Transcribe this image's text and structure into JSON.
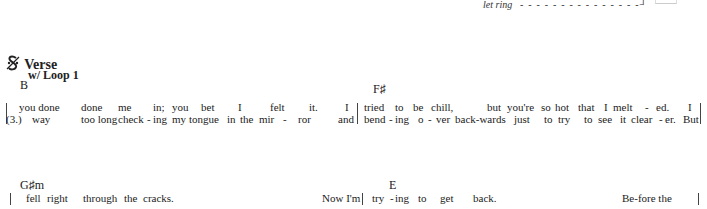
{
  "header": {
    "let_ring_label": "let ring",
    "let_ring_dashes": "- - - - - - - - - - - - - - -┘"
  },
  "section": {
    "segno_symbol": "𝄋",
    "segno_fallback": "%",
    "title": "Verse",
    "loop_label": "w/ Loop 1"
  },
  "system1": {
    "chords": [
      {
        "name": "B",
        "x": 20,
        "y": 78
      },
      {
        "name": "F♯",
        "x": 373,
        "y": 82
      }
    ],
    "line1": [
      {
        "t": "you done",
        "x": 19
      },
      {
        "t": "done",
        "x": 81
      },
      {
        "t": "me",
        "x": 118
      },
      {
        "t": "in;",
        "x": 153
      },
      {
        "t": "you",
        "x": 172
      },
      {
        "t": "bet",
        "x": 201
      },
      {
        "t": "I",
        "x": 238
      },
      {
        "t": "felt",
        "x": 270
      },
      {
        "t": "it.",
        "x": 309
      },
      {
        "t": "I",
        "x": 345
      },
      {
        "t": "tried",
        "x": 364
      },
      {
        "t": "to",
        "x": 395
      },
      {
        "t": "be",
        "x": 413
      },
      {
        "t": "chill,",
        "x": 431
      },
      {
        "t": "but",
        "x": 487
      },
      {
        "t": "you're",
        "x": 507
      },
      {
        "t": "so",
        "x": 541
      },
      {
        "t": "hot",
        "x": 555
      },
      {
        "t": "that",
        "x": 578
      },
      {
        "t": "I",
        "x": 604
      },
      {
        "t": "melt",
        "x": 613
      },
      {
        "t": "-",
        "x": 645
      },
      {
        "t": "ed.",
        "x": 656
      },
      {
        "t": "I",
        "x": 688
      }
    ],
    "line2": [
      {
        "t": "(3.)",
        "x": 6
      },
      {
        "t": "way",
        "x": 32
      },
      {
        "t": "too long",
        "x": 81
      },
      {
        "t": "check",
        "x": 118
      },
      {
        "t": "-",
        "x": 147
      },
      {
        "t": "ing",
        "x": 153
      },
      {
        "t": "my",
        "x": 172
      },
      {
        "t": "tongue",
        "x": 189
      },
      {
        "t": "in",
        "x": 227
      },
      {
        "t": "the",
        "x": 240
      },
      {
        "t": "mir",
        "x": 259
      },
      {
        "t": "-",
        "x": 283
      },
      {
        "t": "ror",
        "x": 298
      },
      {
        "t": "and",
        "x": 338
      },
      {
        "t": "bend",
        "x": 364
      },
      {
        "t": "-",
        "x": 389
      },
      {
        "t": "ing",
        "x": 395
      },
      {
        "t": "o",
        "x": 418
      },
      {
        "t": "-",
        "x": 428
      },
      {
        "t": "ver",
        "x": 436
      },
      {
        "t": "back-wards",
        "x": 455
      },
      {
        "t": "just",
        "x": 514
      },
      {
        "t": "to",
        "x": 544
      },
      {
        "t": "try",
        "x": 558
      },
      {
        "t": "to",
        "x": 584
      },
      {
        "t": "see",
        "x": 598
      },
      {
        "t": "it",
        "x": 620
      },
      {
        "t": "clear",
        "x": 631
      },
      {
        "t": "-",
        "x": 659
      },
      {
        "t": "er.",
        "x": 665
      },
      {
        "t": "But",
        "x": 683
      }
    ]
  },
  "system2": {
    "chords": [
      {
        "name": "G♯m",
        "x": 20,
        "y": 178
      },
      {
        "name": "E",
        "x": 389,
        "y": 178
      }
    ],
    "line1": [
      {
        "t": "fell",
        "x": 26
      },
      {
        "t": "right",
        "x": 47
      },
      {
        "t": "through",
        "x": 83
      },
      {
        "t": "the",
        "x": 124
      },
      {
        "t": "cracks.",
        "x": 143
      },
      {
        "t": "Now I'm",
        "x": 322
      },
      {
        "t": "try",
        "x": 372
      },
      {
        "t": "-",
        "x": 390
      },
      {
        "t": "ing",
        "x": 395
      },
      {
        "t": "to",
        "x": 418
      },
      {
        "t": "get",
        "x": 440
      },
      {
        "t": "back.",
        "x": 473
      },
      {
        "t": "Be-fore the",
        "x": 622
      }
    ]
  }
}
